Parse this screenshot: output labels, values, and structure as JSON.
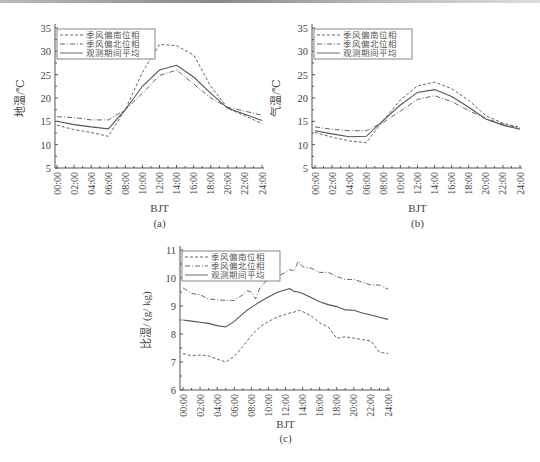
{
  "chart_data": [
    {
      "type": "line",
      "panel_label": "(a)",
      "title": "",
      "xlabel": "BJT",
      "ylabel": "地温/℃",
      "ylim": [
        5,
        35
      ],
      "yticks": [
        5,
        10,
        15,
        20,
        25,
        30,
        35
      ],
      "x": [
        "00:00",
        "02:00",
        "04:00",
        "06:00",
        "08:00",
        "10:00",
        "12:00",
        "14:00",
        "16:00",
        "18:00",
        "20:00",
        "22:00",
        "24:00"
      ],
      "grid": false,
      "legend_position": "upper-left",
      "series": [
        {
          "name": "季风偏南位相",
          "style": "dashed",
          "values": [
            14.2,
            13.2,
            12.6,
            11.8,
            17.5,
            25.5,
            31.5,
            31.2,
            29.2,
            22.5,
            17.8,
            16.2,
            14.5
          ]
        },
        {
          "name": "季风偏北位相",
          "style": "dash-dot",
          "values": [
            16.0,
            15.8,
            15.3,
            15.3,
            17.5,
            21.0,
            24.8,
            26.0,
            23.0,
            20.0,
            18.0,
            17.2,
            16.3
          ]
        },
        {
          "name": "观测期间平均",
          "style": "solid",
          "values": [
            15.0,
            14.3,
            13.8,
            13.4,
            17.5,
            22.5,
            26.0,
            27.0,
            24.5,
            21.0,
            17.8,
            16.5,
            15.2
          ]
        }
      ]
    },
    {
      "type": "line",
      "panel_label": "(b)",
      "title": "",
      "xlabel": "BJT",
      "ylabel": "气温/℃",
      "ylim": [
        5,
        35
      ],
      "yticks": [
        5,
        10,
        15,
        20,
        25,
        30,
        35
      ],
      "x": [
        "00:00",
        "02:00",
        "04:00",
        "06:00",
        "08:00",
        "10:00",
        "12:00",
        "14:00",
        "16:00",
        "18:00",
        "20:00",
        "22:00",
        "24:00"
      ],
      "grid": false,
      "legend_position": "upper-left",
      "series": [
        {
          "name": "季风偏南位相",
          "style": "dashed",
          "values": [
            12.6,
            11.6,
            10.8,
            10.4,
            15.2,
            19.6,
            22.6,
            23.4,
            22.0,
            19.5,
            16.2,
            14.6,
            13.7
          ]
        },
        {
          "name": "季风偏北位相",
          "style": "dash-dot",
          "values": [
            13.8,
            13.3,
            13.0,
            13.0,
            14.8,
            17.2,
            19.7,
            20.5,
            19.2,
            17.3,
            15.6,
            14.4,
            13.5
          ]
        },
        {
          "name": "观测期间平均",
          "style": "solid",
          "values": [
            13.0,
            12.3,
            11.7,
            11.8,
            15.2,
            18.5,
            21.2,
            21.8,
            20.3,
            18.0,
            15.5,
            14.2,
            13.3
          ]
        }
      ]
    },
    {
      "type": "line",
      "panel_label": "(c)",
      "title": "",
      "xlabel": "BJT",
      "ylabel": "比湿/ (g/ kg)",
      "ylim": [
        6,
        11
      ],
      "yticks": [
        6,
        7,
        8,
        9,
        10,
        11
      ],
      "x": [
        "00:00",
        "01:00",
        "02:00",
        "03:00",
        "04:00",
        "05:00",
        "06:00",
        "07:00",
        "07:30",
        "08:00",
        "08:30",
        "09:00",
        "10:00",
        "11:00",
        "12:00",
        "12:30",
        "13:00",
        "13:30",
        "14:00",
        "15:00",
        "16:00",
        "17:00",
        "18:00",
        "19:00",
        "20:00",
        "21:00",
        "22:00",
        "23:00",
        "24:00"
      ],
      "grid": false,
      "legend_position": "upper-left",
      "series": [
        {
          "name": "季风偏南位相",
          "style": "dashed",
          "values": [
            7.3,
            7.22,
            7.25,
            7.22,
            7.1,
            7.0,
            7.2,
            7.55,
            7.75,
            7.95,
            8.1,
            8.25,
            8.45,
            8.6,
            8.7,
            8.75,
            8.78,
            8.85,
            8.8,
            8.65,
            8.4,
            8.25,
            7.85,
            7.9,
            7.85,
            7.8,
            7.75,
            7.35,
            7.3
          ]
        },
        {
          "name": "季风偏北位相",
          "style": "dash-dot",
          "values": [
            9.65,
            9.45,
            9.4,
            9.25,
            9.22,
            9.2,
            9.2,
            9.4,
            9.55,
            9.5,
            9.25,
            9.65,
            9.98,
            10.05,
            10.2,
            10.3,
            10.25,
            10.6,
            10.4,
            10.35,
            10.2,
            10.2,
            10.05,
            9.95,
            9.95,
            9.85,
            9.75,
            9.75,
            9.6
          ]
        },
        {
          "name": "观测期间平均",
          "style": "solid",
          "values": [
            8.5,
            8.46,
            8.42,
            8.38,
            8.3,
            8.25,
            8.45,
            8.72,
            8.85,
            8.95,
            9.05,
            9.15,
            9.32,
            9.48,
            9.58,
            9.62,
            9.52,
            9.5,
            9.45,
            9.3,
            9.15,
            9.05,
            8.98,
            8.86,
            8.85,
            8.75,
            8.68,
            8.6,
            8.52
          ]
        }
      ]
    }
  ],
  "legend": {
    "items": [
      "季风偏南位相",
      "季风偏北位相",
      "观测期间平均"
    ]
  },
  "panels": {
    "a": {
      "label": "(a)",
      "xlabel": "BJT",
      "ylabel": "地温/℃"
    },
    "b": {
      "label": "(b)",
      "xlabel": "BJT",
      "ylabel": "气温/℃"
    },
    "c": {
      "label": "(c)",
      "xlabel": "BJT",
      "ylabel": "比湿/ (g/ kg)"
    }
  },
  "colors": {
    "axis": "#555555",
    "line": "#555555",
    "text": "#444444"
  }
}
